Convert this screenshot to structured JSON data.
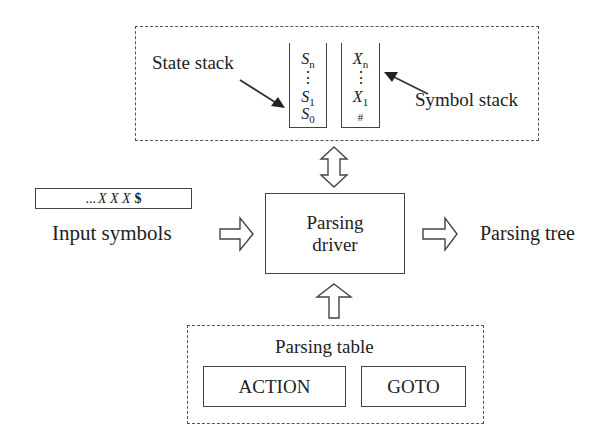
{
  "diagram": {
    "type": "LR parser architecture",
    "stack_region": {
      "state_stack_label": "State stack",
      "symbol_stack_label": "Symbol stack",
      "state_stack": {
        "top": "S",
        "top_sub": "n",
        "dots": "⋮",
        "second": "S",
        "second_sub": "1",
        "bottom": "S",
        "bottom_sub": "0"
      },
      "symbol_stack": {
        "top": "X",
        "top_sub": "n",
        "dots": "⋮",
        "second": "X",
        "second_sub": "1",
        "bottom": "#"
      }
    },
    "input": {
      "buffer_prefix": "...",
      "buffer_symbols": "X X X",
      "buffer_end": "$",
      "label": "Input symbols"
    },
    "driver": {
      "line1": "Parsing",
      "line2": "driver"
    },
    "output": {
      "label": "Parsing tree"
    },
    "table": {
      "label": "Parsing table",
      "action_label": "ACTION",
      "goto_label": "GOTO"
    },
    "arrows": [
      {
        "name": "stack-driver-bidirectional",
        "style": "hollow-double"
      },
      {
        "name": "input-to-driver",
        "style": "hollow-right"
      },
      {
        "name": "driver-to-tree",
        "style": "hollow-right"
      },
      {
        "name": "table-to-driver",
        "style": "hollow-up"
      },
      {
        "name": "state-stack-pointer",
        "style": "solid-arrow"
      },
      {
        "name": "symbol-stack-pointer",
        "style": "solid-arrow"
      }
    ],
    "colors": {
      "line": "#444444",
      "text": "#222222",
      "background": "#ffffff"
    }
  }
}
